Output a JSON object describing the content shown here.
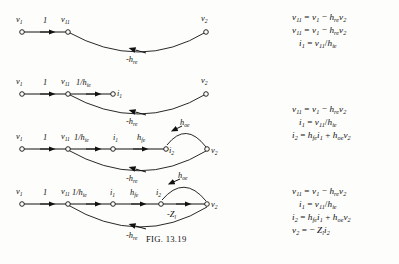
{
  "figure": {
    "caption": "FIG. 13.19",
    "caption_prefix": "Fig.",
    "caption_number": "13.19"
  },
  "graphs": [
    {
      "id": "graph-1",
      "nodes": [
        {
          "name": "v1",
          "label": "v",
          "sub": "1"
        },
        {
          "name": "v11",
          "label": "v",
          "sub": "11"
        },
        {
          "name": "v2",
          "label": "v",
          "sub": "2"
        }
      ],
      "edges": [
        {
          "name": "edge-v1-v11",
          "label": "1",
          "sub": ""
        },
        {
          "name": "edge-v2-v11",
          "label": "-h",
          "sub": "re"
        }
      ]
    },
    {
      "id": "graph-2",
      "nodes": [
        {
          "name": "v1",
          "label": "v",
          "sub": "1"
        },
        {
          "name": "v11",
          "label": "v",
          "sub": "11"
        },
        {
          "name": "i1",
          "label": "i",
          "sub": "1"
        },
        {
          "name": "v2",
          "label": "v",
          "sub": "2"
        }
      ],
      "edges": [
        {
          "name": "edge-v1-v11",
          "label": "1",
          "sub": ""
        },
        {
          "name": "edge-v11-i1",
          "label": "1/h",
          "sub": "ie"
        },
        {
          "name": "edge-v2-v11",
          "label": "-h",
          "sub": "re"
        }
      ]
    },
    {
      "id": "graph-3",
      "nodes": [
        {
          "name": "v1",
          "label": "v",
          "sub": "1"
        },
        {
          "name": "v11",
          "label": "v",
          "sub": "11"
        },
        {
          "name": "i1",
          "label": "i",
          "sub": "1"
        },
        {
          "name": "i2",
          "label": "i",
          "sub": "2"
        },
        {
          "name": "v2",
          "label": "v",
          "sub": "2"
        }
      ],
      "edges": [
        {
          "name": "edge-v1-v11",
          "label": "1",
          "sub": ""
        },
        {
          "name": "edge-v11-i1",
          "label": "1/h",
          "sub": "ie"
        },
        {
          "name": "edge-i1-i2",
          "label": "h",
          "sub": "fe"
        },
        {
          "name": "edge-v2-i2",
          "label": "h",
          "sub": "oe"
        },
        {
          "name": "edge-v2-v11",
          "label": "-h",
          "sub": "re"
        }
      ]
    },
    {
      "id": "graph-4",
      "nodes": [
        {
          "name": "v1",
          "label": "v",
          "sub": "1"
        },
        {
          "name": "v11",
          "label": "v",
          "sub": "11"
        },
        {
          "name": "i1",
          "label": "i",
          "sub": "1"
        },
        {
          "name": "i2",
          "label": "i",
          "sub": "2"
        },
        {
          "name": "v2",
          "label": "v",
          "sub": "2"
        }
      ],
      "edges": [
        {
          "name": "edge-v1-v11",
          "label": "1",
          "sub": ""
        },
        {
          "name": "edge-v11-i1",
          "label": "1/h",
          "sub": "ie"
        },
        {
          "name": "edge-i1-i2",
          "label": "h",
          "sub": "fe"
        },
        {
          "name": "edge-i2-v2",
          "label": "-Z",
          "sub": "l"
        },
        {
          "name": "edge-v2-i2",
          "label": "h",
          "sub": "oe"
        },
        {
          "name": "edge-v2-v11",
          "label": "-h",
          "sub": "re"
        }
      ]
    }
  ],
  "equations": {
    "block1": [
      {
        "name": "eq-v11",
        "text": "v11 = v1 - hre v2"
      },
      {
        "name": "eq-v11-dup",
        "text": "v11 = v1 - hre v2"
      },
      {
        "name": "eq-i1",
        "text": "i1 = v11 / hie"
      }
    ],
    "block2": [
      {
        "name": "eq-v11",
        "text": "v11 = v1 - hre v2"
      },
      {
        "name": "eq-i1",
        "text": "i1 = v11 / hie"
      },
      {
        "name": "eq-i2",
        "text": "i2 = hfe i1 + hoe v2"
      }
    ],
    "block3": [
      {
        "name": "eq-v11",
        "text": "v11 = v1 - hre v2"
      },
      {
        "name": "eq-i1",
        "text": "i1 = v11 / hie"
      },
      {
        "name": "eq-i2",
        "text": "i2 = hfe i1 + hoe v2"
      },
      {
        "name": "eq-v2",
        "text": "v2 = - Zl i2"
      }
    ]
  },
  "colors": {
    "ink": "#111111",
    "paper": "#fdfdfb"
  }
}
